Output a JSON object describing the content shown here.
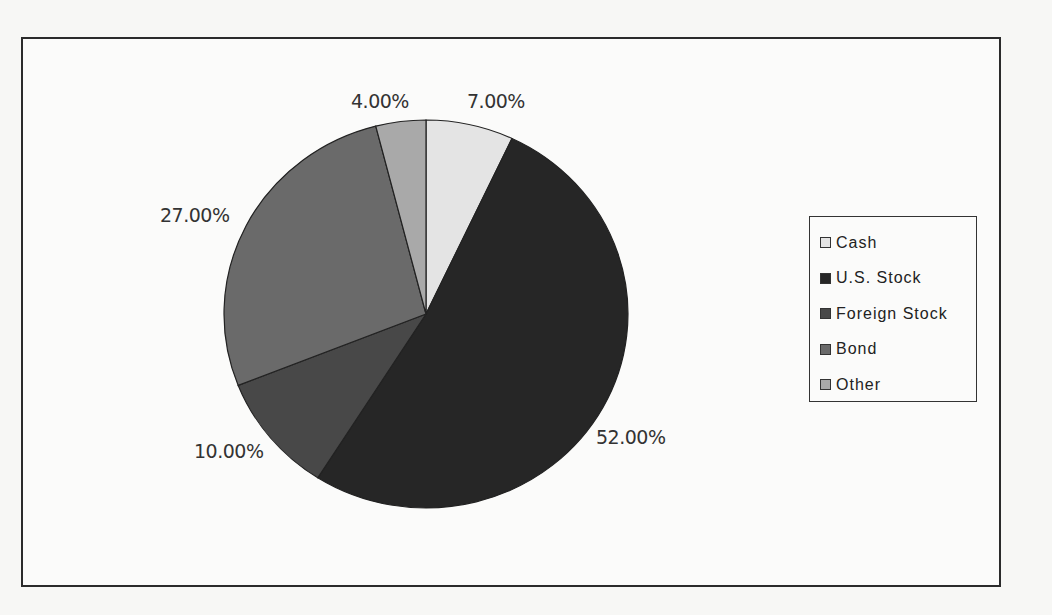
{
  "chart_data": {
    "type": "pie",
    "title": "",
    "categories": [
      "Cash",
      "U.S. Stock",
      "Foreign Stock",
      "Bond",
      "Other"
    ],
    "values": [
      7.0,
      52.0,
      10.0,
      27.0,
      4.0
    ],
    "data_labels": [
      "7.00%",
      "52.00%",
      "10.00%",
      "27.00%",
      "4.00%"
    ],
    "colors": [
      "#e4e4e4",
      "#262626",
      "#484848",
      "#6a6a6a",
      "#a9a9a9"
    ],
    "start_angle_deg": 0,
    "direction": "clockwise",
    "legend_position": "right"
  },
  "legend": {
    "items": [
      {
        "label": "Cash",
        "color": "#e4e4e4"
      },
      {
        "label": "U.S. Stock",
        "color": "#262626"
      },
      {
        "label": "Foreign Stock",
        "color": "#484848"
      },
      {
        "label": "Bond",
        "color": "#6a6a6a"
      },
      {
        "label": "Other",
        "color": "#a9a9a9"
      }
    ]
  },
  "labels": {
    "cash": "7.00%",
    "us_stock": "52.00%",
    "foreign_stock": "10.00%",
    "bond": "27.00%",
    "other": "4.00%"
  }
}
